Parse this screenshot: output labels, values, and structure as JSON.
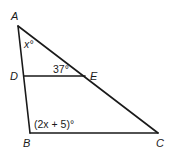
{
  "figure": {
    "type": "triangle-with-parallel-segment",
    "vertices": {
      "A": {
        "label": "A"
      },
      "B": {
        "label": "B"
      },
      "C": {
        "label": "C"
      },
      "D": {
        "label": "D"
      },
      "E": {
        "label": "E"
      }
    },
    "angles": {
      "at_A": "x°",
      "at_D_DE_EA": "37°",
      "at_B": "(2x + 5)°"
    },
    "segments": [
      "AB",
      "AC",
      "BC",
      "DE"
    ],
    "colors": {
      "stroke": "#1a1a1a",
      "background": "#ffffff"
    }
  }
}
